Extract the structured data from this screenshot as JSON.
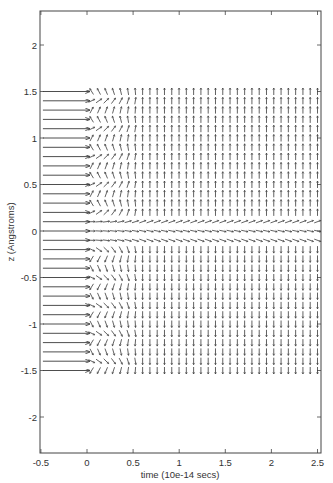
{
  "chart_data": {
    "type": "quiver",
    "title": "",
    "xlabel": "time (10e-14 secs)",
    "ylabel": "z (Angstroms)",
    "xlim": [
      -0.5,
      2.55
    ],
    "ylim": [
      -2.35,
      2.35
    ],
    "xticks": [
      -0.5,
      0,
      0.5,
      1,
      1.5,
      2,
      2.5
    ],
    "xtick_labels": [
      "-0.5",
      "0",
      "0.5",
      "1",
      "1.5",
      "2",
      "2.5"
    ],
    "yticks": [
      -2,
      -1.5,
      -1,
      -0.5,
      0,
      0.5,
      1,
      1.5,
      2
    ],
    "ytick_labels": [
      "-2",
      "-1.5",
      "-1",
      "-0.5",
      "0",
      "0.5",
      "1",
      "1.5",
      "2"
    ],
    "grid": false,
    "legend": null,
    "rows_z": {
      "start": 1.5,
      "stop": -1.5,
      "step": -0.1
    },
    "initial_arrows": {
      "t_start": -0.5,
      "t_end": 0.03,
      "direction": "right"
    },
    "field_columns_t": {
      "start": 0.05,
      "stop": 2.5,
      "count": 32
    },
    "field_arrow_length": 0.055,
    "late_time_direction": {
      "z_gt_0.15": "up",
      "z_lt_-0.15": "down",
      "z_0.1": "right-up (~20deg)",
      "z_0": "right (~-15deg)",
      "z_-0.1": "right-down (~-20deg)"
    },
    "transition_region_t": [
      0.0,
      0.6
    ],
    "pen_color": "#3a3a3a"
  },
  "axes": {
    "x_label": "time (10e-14 secs)",
    "y_label": "z (Angstroms)"
  }
}
